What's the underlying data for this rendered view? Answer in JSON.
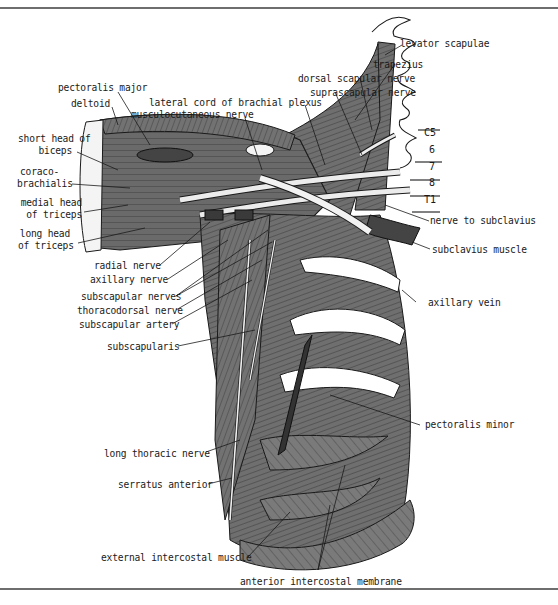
{
  "figure": {
    "colors": {
      "muscle": "#6f6f6f",
      "muscle_dark": "#4a4a4a",
      "nerve": "#e6e6e6",
      "outline": "#1a1a1a",
      "background": "#ffffff",
      "rule": "#6e6e6e"
    }
  },
  "labels": {
    "levator_scapulae": "levator scapulae",
    "trapezius": "trapezius",
    "dorsal_scapular_nerve": "dorsal scapular nerve",
    "suprascapular_nerve": "suprascapular nerve",
    "lateral_cord": "lateral cord of brachial plexus",
    "musculocutaneous_nerve": "musculocutaneous nerve",
    "pectoralis_major": "pectoralis major",
    "deltoid": "deltoid",
    "short_head_biceps_1": "short head of",
    "short_head_biceps_2": "biceps",
    "coracobrachialis_1": "coraco-",
    "coracobrachialis_2": "brachialis",
    "medial_head_triceps_1": "medial head",
    "medial_head_triceps_2": "of triceps",
    "long_head_triceps_1": "long head",
    "long_head_triceps_2": "of triceps",
    "radial_nerve": "radial nerve",
    "axillary_nerve": "axillary nerve",
    "subscapular_nerves": "subscapular nerves",
    "thoracodorsal_nerve": "thoracodorsal nerve",
    "subscapular_artery": "subscapular artery",
    "subscapularis": "subscapularis",
    "long_thoracic_nerve": "long thoracic nerve",
    "serratus_anterior": "serratus anterior",
    "external_intercostal_muscle": "external intercostal muscle",
    "anterior_intercostal_membrane": "anterior intercostal membrane",
    "pectoralis_minor": "pectoralis minor",
    "axillary_vein": "axillary vein",
    "subclavius_muscle": "subclavius muscle",
    "nerve_to_subclavius": "nerve to subclavius"
  },
  "spinal_levels": [
    "C5",
    "6",
    "7",
    "8",
    "T1"
  ]
}
